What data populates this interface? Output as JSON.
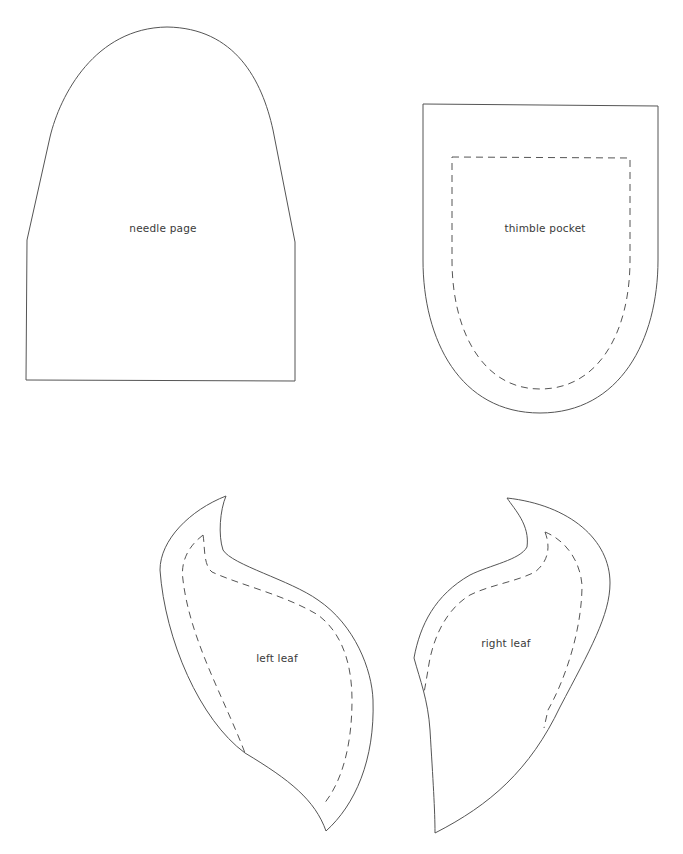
{
  "sheet": {
    "background": "#ffffff",
    "line_color": "#555555"
  },
  "pieces": [
    {
      "id": "needle-page",
      "label": "needle page",
      "has_seam_line": false
    },
    {
      "id": "thimble-pocket",
      "label": "thimble pocket",
      "has_seam_line": true
    },
    {
      "id": "left-leaf",
      "label": "left leaf",
      "has_seam_line": true
    },
    {
      "id": "right-leaf",
      "label": "right leaf",
      "has_seam_line": true
    }
  ]
}
